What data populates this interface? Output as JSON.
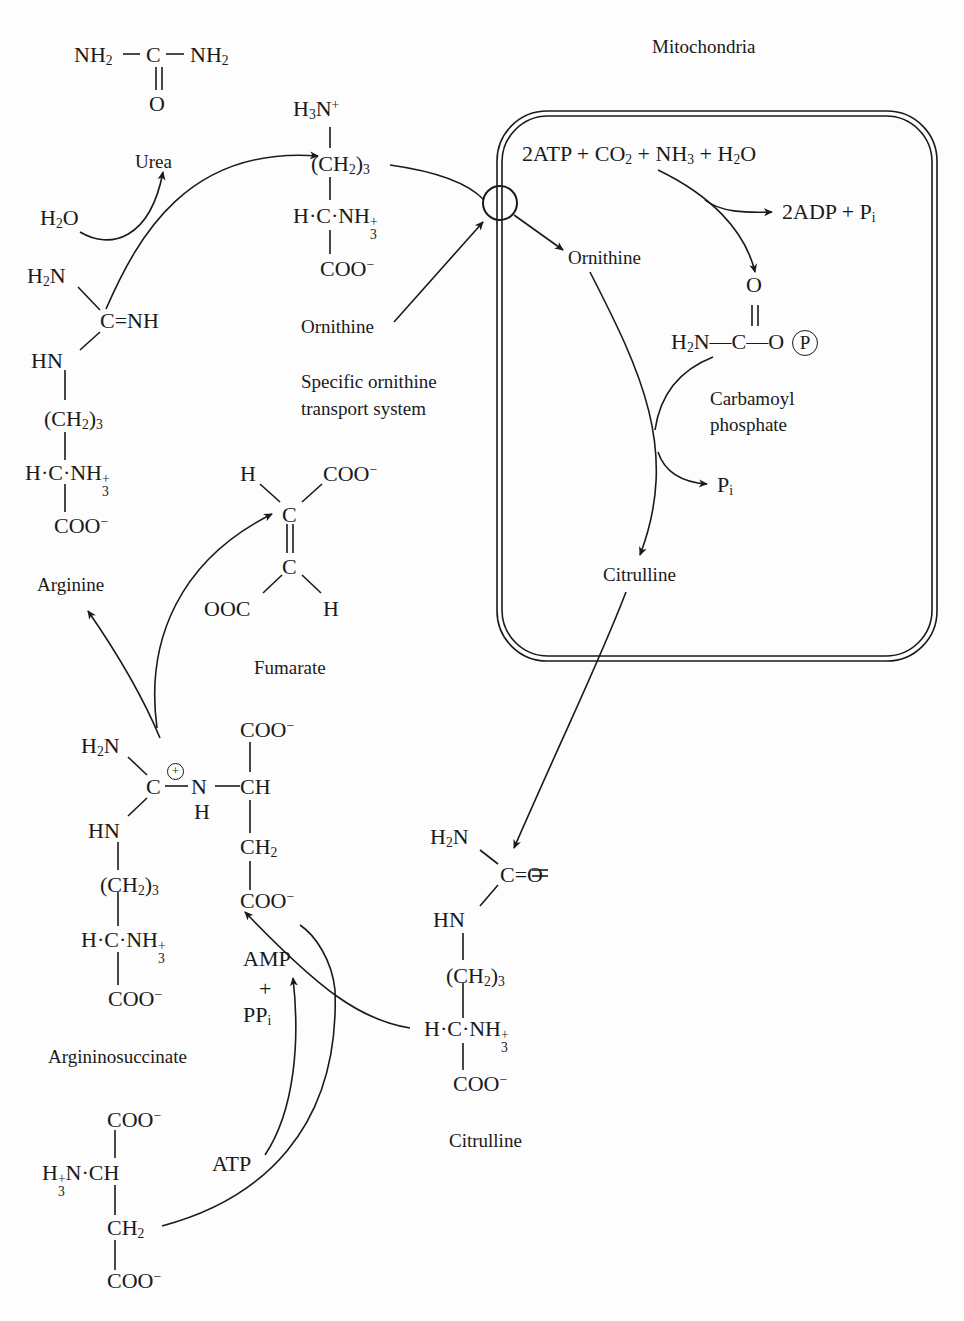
{
  "compartment": {
    "label": "Mitochondria"
  },
  "urea": {
    "formula_left": "NH",
    "formula_center": "C",
    "formula_right": "NH",
    "carbonyl_o": "O",
    "name": "Urea"
  },
  "water": {
    "h": "H",
    "o": "O"
  },
  "ornithine_structure": {
    "amine": "H",
    "amine_n": "N",
    "chain": "(CH",
    "chain_close": ")",
    "chain_sub": "3",
    "alpha": "H·C·NH",
    "carboxyl": "COO",
    "name": "Ornithine"
  },
  "transport": {
    "line1": "Specific ornithine",
    "line2": "transport system"
  },
  "mito_reaction": {
    "reactants": "2ATP + CO",
    "reactants_2": " + NH",
    "reactants_3": " + H",
    "reactants_4": "O",
    "products": "2ADP + P",
    "products_sub": "i",
    "ornithine_label": "Ornithine",
    "carbamoyl_o": "O",
    "carbamoyl_formula": "H",
    "carbamoyl_formula_2": "N—C—O",
    "phosphate_symbol": "P",
    "carbamoyl_name_1": "Carbamoyl",
    "carbamoyl_name_2": "phosphate",
    "pi": "P",
    "pi_sub": "i",
    "citrulline_label": "Citrulline"
  },
  "arginine": {
    "h2n": "H",
    "h2n_n": "N",
    "cnh": "C=NH",
    "hn": "HN",
    "chain": "(CH",
    "chain_close": ")",
    "chain_sub": "3",
    "alpha": "H·C·NH",
    "carboxyl": "COO",
    "name": "Arginine"
  },
  "fumarate": {
    "h_top": "H",
    "coo_top": "COO",
    "c1": "C",
    "c2": "C",
    "ooc": "OOC",
    "h_bottom": "H",
    "name": "Fumarate"
  },
  "argininosuccinate": {
    "h2n": "H",
    "h2n_n": "N",
    "c": "C",
    "plus": "+",
    "n": "N",
    "nh": "H",
    "ch": "CH",
    "coo_top": "COO",
    "ch2": "CH",
    "coo_bottom": "COO",
    "hn": "HN",
    "chain": "(CH",
    "chain_close": ")",
    "chain_sub": "3",
    "alpha": "H·C·NH",
    "carboxyl": "COO",
    "name": "Argininosuccinate"
  },
  "cofactors": {
    "amp": "AMP",
    "plus": "+",
    "ppi": "PP",
    "ppi_sub": "i",
    "atp": "ATP"
  },
  "citrulline": {
    "h2n": "H",
    "h2n_n": "N",
    "co": "C=O",
    "hn": "HN",
    "chain": "(CH",
    "chain_close": ")",
    "chain_sub": "3",
    "alpha": "H·C·NH",
    "carboxyl": "COO",
    "name": "Citrulline"
  },
  "aspartate": {
    "coo_top": "COO",
    "alpha": "N·CH",
    "ch2": "CH",
    "coo_bottom": "COO"
  },
  "colors": {
    "ink": "#1a1a1a",
    "background": "#fdfdfd"
  }
}
